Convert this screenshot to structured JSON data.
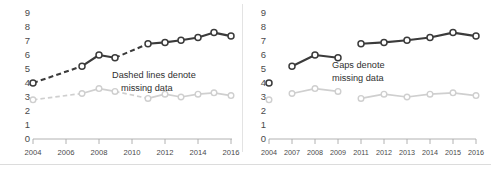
{
  "figure": {
    "panels": [
      "left",
      "right"
    ],
    "divider": true
  },
  "chart_data": [
    {
      "id": "left",
      "type": "line",
      "title": "",
      "xlabel": "",
      "ylabel": "",
      "xlim": [
        2004,
        2016
      ],
      "ylim": [
        0,
        9
      ],
      "grid": false,
      "legend": "none",
      "xticks": [
        "2004",
        "2006",
        "2008",
        "2010",
        "2012",
        "2014",
        "2016"
      ],
      "yticks": [
        "0",
        "1",
        "2",
        "3",
        "4",
        "5",
        "6",
        "7",
        "8",
        "9"
      ],
      "annotation": "Dashed lines denote\nmissing data",
      "annotation_line1": "Dashed lines denote",
      "annotation_line2": "missing data",
      "series": [
        {
          "name": "dark",
          "color": "#3b3b3b",
          "x": [
            2004,
            2007,
            2008,
            2009,
            2011,
            2012,
            2013,
            2014,
            2015,
            2016
          ],
          "values": [
            4.0,
            5.2,
            6.0,
            5.8,
            6.8,
            6.9,
            7.05,
            7.25,
            7.6,
            7.35
          ],
          "dashed_segments": [
            [
              2004,
              2007
            ],
            [
              2009,
              2011
            ]
          ]
        },
        {
          "name": "light",
          "color": "#cfcfcf",
          "x": [
            2004,
            2007,
            2008,
            2009,
            2011,
            2012,
            2013,
            2014,
            2015,
            2016
          ],
          "values": [
            2.8,
            3.25,
            3.6,
            3.4,
            2.9,
            3.2,
            3.0,
            3.2,
            3.3,
            3.1
          ],
          "dashed_segments": [
            [
              2004,
              2007
            ],
            [
              2009,
              2011
            ]
          ]
        }
      ]
    },
    {
      "id": "right",
      "type": "line",
      "title": "",
      "xlabel": "",
      "ylabel": "",
      "xlim": [
        2004,
        2016
      ],
      "ylim": [
        0,
        9
      ],
      "grid": false,
      "legend": "none",
      "xticks": [
        "2004",
        "2007",
        "2008",
        "2009",
        "2011",
        "2012",
        "2013",
        "2014",
        "2015",
        "2016"
      ],
      "yticks": [
        "0",
        "1",
        "2",
        "3",
        "4",
        "5",
        "6",
        "7",
        "8",
        "9"
      ],
      "annotation": "Gaps denote\nmissing data",
      "annotation_line1": "Gaps denote",
      "annotation_line2": "missing data",
      "series": [
        {
          "name": "dark",
          "color": "#3b3b3b",
          "x": [
            2004,
            2007,
            2008,
            2009,
            2011,
            2012,
            2013,
            2014,
            2015,
            2016
          ],
          "values": [
            4.0,
            5.2,
            6.0,
            5.8,
            6.8,
            6.9,
            7.05,
            7.25,
            7.6,
            7.35
          ],
          "connected_groups": [
            [
              2004
            ],
            [
              2007,
              2008,
              2009
            ],
            [
              2011,
              2012,
              2013,
              2014,
              2015,
              2016
            ]
          ]
        },
        {
          "name": "light",
          "color": "#cfcfcf",
          "x": [
            2004,
            2007,
            2008,
            2009,
            2011,
            2012,
            2013,
            2014,
            2015,
            2016
          ],
          "values": [
            2.8,
            3.25,
            3.6,
            3.4,
            2.9,
            3.2,
            3.0,
            3.2,
            3.3,
            3.1
          ],
          "connected_groups": [
            [
              2004
            ],
            [
              2007,
              2008,
              2009
            ],
            [
              2011,
              2012,
              2013,
              2014,
              2015,
              2016
            ]
          ]
        }
      ]
    }
  ]
}
